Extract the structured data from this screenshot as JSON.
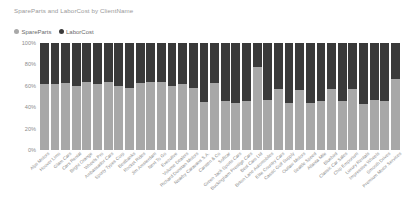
{
  "chart_data": {
    "type": "bar",
    "subtype": "stacked-percentage",
    "title": "SpareParts and LaborCost by ClientName",
    "xlabel": "",
    "ylabel": "",
    "ylim": [
      0,
      100
    ],
    "ytick_labels": [
      "100%",
      "80%",
      "60%",
      "40%",
      "20%",
      "0%"
    ],
    "ytick_values": [
      100,
      80,
      60,
      40,
      20,
      0
    ],
    "grid": false,
    "legend_position": "top-left",
    "legend": [
      "SpareParts",
      "LaborCost"
    ],
    "colors": {
      "SpareParts": "#a8a8a8",
      "LaborCost": "#3a3a3a",
      "title_text": "#9a9a9a",
      "axis_text": "#8d8d8d",
      "background": "#ffffff"
    },
    "categories": [
      "Alps Motors",
      "Hoover Limo",
      "Glam Cars",
      "Cars Rental",
      "Bright Orange",
      "Wheels Pro",
      "Ambassador Cars",
      "Sporty Types Corp",
      "Bestbanks",
      "Rocket Rides",
      "Jim Amsterdam",
      "Next To Go",
      "Executive",
      "Volume Dealers",
      "Richard Dunstan Motors",
      "Nearby Caravans S.A.",
      "Carsten & Co",
      "Softcar",
      "Green Jack Sports Cars",
      "Buckingham Prestige Cars",
      "Best Cars Ltd",
      "Briton Lane Automobiles",
      "Elite Country Cars",
      "Cassic Golf Supply",
      "Outlaw Motors",
      "Seattle Speed",
      "Atlanta Mile",
      "Bluebird",
      "Classic Car Sales",
      "Chip Emporium",
      "Luxury Rentals",
      "Impressive Wheels",
      "Smooth Drives",
      "Premium Motor Services"
    ],
    "series": [
      {
        "name": "SpareParts",
        "color": "#a8a8a8",
        "values": [
          62,
          62,
          63,
          60,
          64,
          62,
          64,
          60,
          58,
          63,
          64,
          64,
          60,
          62,
          58,
          45,
          63,
          46,
          44,
          46,
          78,
          47,
          57,
          44,
          56,
          44,
          46,
          57,
          46,
          57,
          43,
          47,
          46,
          66
        ]
      },
      {
        "name": "LaborCost",
        "color": "#3a3a3a",
        "values": [
          38,
          38,
          37,
          40,
          36,
          38,
          36,
          40,
          42,
          37,
          36,
          36,
          40,
          38,
          42,
          55,
          37,
          54,
          56,
          54,
          22,
          53,
          43,
          56,
          44,
          56,
          54,
          43,
          54,
          43,
          57,
          53,
          54,
          34
        ]
      }
    ]
  }
}
